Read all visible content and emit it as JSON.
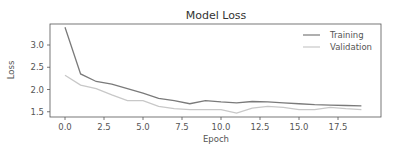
{
  "chart_data": {
    "type": "line",
    "title": "Model Loss",
    "xlabel": "Epoch",
    "ylabel": "Loss",
    "x": [
      0,
      1,
      2,
      3,
      4,
      5,
      6,
      7,
      8,
      9,
      10,
      11,
      12,
      13,
      14,
      15,
      16,
      17,
      18,
      19
    ],
    "series": [
      {
        "name": "Training",
        "color": "#7a7a7a",
        "values": [
          3.4,
          2.35,
          2.18,
          2.12,
          2.02,
          1.92,
          1.8,
          1.75,
          1.68,
          1.75,
          1.72,
          1.7,
          1.73,
          1.72,
          1.7,
          1.68,
          1.66,
          1.65,
          1.64,
          1.63
        ]
      },
      {
        "name": "Validation",
        "color": "#c8c8c8",
        "values": [
          2.32,
          2.1,
          2.02,
          1.88,
          1.75,
          1.75,
          1.62,
          1.57,
          1.55,
          1.55,
          1.55,
          1.47,
          1.58,
          1.62,
          1.6,
          1.55,
          1.55,
          1.6,
          1.57,
          1.55
        ]
      }
    ],
    "xticks": [
      "0.0",
      "2.5",
      "5.0",
      "7.5",
      "10.0",
      "12.5",
      "15.0",
      "17.5"
    ],
    "xtick_values": [
      0,
      2.5,
      5,
      7.5,
      10,
      12.5,
      15,
      17.5
    ],
    "yticks": [
      "1.5",
      "2.0",
      "2.5",
      "3.0"
    ],
    "ytick_values": [
      1.5,
      2.0,
      2.5,
      3.0
    ],
    "xlim": [
      -0.95,
      20.0
    ],
    "ylim": [
      1.38,
      3.47
    ],
    "grid": false,
    "legend_position": "upper right"
  }
}
